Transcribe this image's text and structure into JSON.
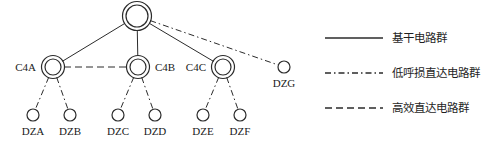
{
  "diagram": {
    "type": "network-hierarchy",
    "title": "",
    "nodes": [
      {
        "id": "root",
        "label": "",
        "shape": "double-circle",
        "x": 137,
        "y": 16,
        "r": 11
      },
      {
        "id": "C4A",
        "label": "C4A",
        "shape": "double-circle",
        "x": 53,
        "y": 67,
        "r": 8,
        "label_pos": "left"
      },
      {
        "id": "C4B",
        "label": "C4B",
        "shape": "double-circle",
        "x": 138,
        "y": 67,
        "r": 8,
        "label_pos": "right"
      },
      {
        "id": "C4C",
        "label": "C4C",
        "shape": "double-circle",
        "x": 223,
        "y": 67,
        "r": 8,
        "label_pos": "left"
      },
      {
        "id": "DZG",
        "label": "DZG",
        "shape": "circle",
        "x": 284,
        "y": 67,
        "r": 6,
        "label_pos": "below"
      },
      {
        "id": "DZA",
        "label": "DZA",
        "shape": "circle",
        "x": 33,
        "y": 115,
        "r": 6,
        "label_pos": "below"
      },
      {
        "id": "DZB",
        "label": "DZB",
        "shape": "circle",
        "x": 70,
        "y": 115,
        "r": 6,
        "label_pos": "below"
      },
      {
        "id": "DZC",
        "label": "DZC",
        "shape": "circle",
        "x": 118,
        "y": 115,
        "r": 6,
        "label_pos": "below"
      },
      {
        "id": "DZD",
        "label": "DZD",
        "shape": "circle",
        "x": 155,
        "y": 115,
        "r": 6,
        "label_pos": "below"
      },
      {
        "id": "DZE",
        "label": "DZE",
        "shape": "circle",
        "x": 203,
        "y": 115,
        "r": 6,
        "label_pos": "below"
      },
      {
        "id": "DZF",
        "label": "DZF",
        "shape": "circle",
        "x": 240,
        "y": 115,
        "r": 6,
        "label_pos": "below"
      }
    ],
    "edges": [
      {
        "from": "root",
        "to": "C4A",
        "style": "solid"
      },
      {
        "from": "root",
        "to": "C4B",
        "style": "solid"
      },
      {
        "from": "root",
        "to": "C4C",
        "style": "solid"
      },
      {
        "from": "root",
        "to": "DZG",
        "style": "dash-dot"
      },
      {
        "from": "C4A",
        "to": "C4B",
        "style": "dashed"
      },
      {
        "from": "C4A",
        "to": "DZA",
        "style": "dash-dot"
      },
      {
        "from": "C4A",
        "to": "DZB",
        "style": "dash-dot"
      },
      {
        "from": "C4B",
        "to": "DZC",
        "style": "dash-dot"
      },
      {
        "from": "C4B",
        "to": "DZD",
        "style": "dash-dot"
      },
      {
        "from": "C4C",
        "to": "DZE",
        "style": "dash-dot"
      },
      {
        "from": "C4C",
        "to": "DZF",
        "style": "dash-dot"
      }
    ]
  },
  "legend": {
    "items": [
      {
        "style": "solid",
        "label": "基干电路群",
        "line_y": 38,
        "text_y": 42
      },
      {
        "style": "dash-dot",
        "label": "低呼损直达电路群",
        "line_y": 73,
        "text_y": 77
      },
      {
        "style": "dashed",
        "label": "高效直达电路群",
        "line_y": 108,
        "text_y": 112
      }
    ],
    "line_x1": 325,
    "line_x2": 383,
    "text_x": 392
  },
  "colors": {
    "stroke": "#2b2b2b",
    "text": "#1a1a1a",
    "background": "#ffffff"
  }
}
